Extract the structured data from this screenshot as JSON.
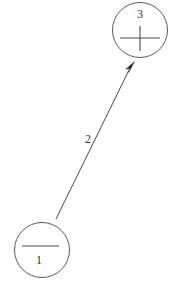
{
  "diagram": {
    "background_color": "#ffffff",
    "stroke_color": "#595959",
    "text_color": "#333333",
    "arrow_color": "#1a1a1a",
    "nodes": [
      {
        "id": "node-1",
        "label": "1",
        "symbol": "minus-sign",
        "symbol_glyph": "−",
        "cx": 42,
        "cy": 250,
        "r": 28
      },
      {
        "id": "node-3",
        "label": "3",
        "symbol": "plus-sign",
        "symbol_glyph": "+",
        "cx": 140,
        "cy": 30,
        "r": 28
      }
    ],
    "edges": [
      {
        "id": "edge-2",
        "label": "2",
        "from": "node-1",
        "to": "node-3",
        "direction": "node-1-to-node-3",
        "label_x": 88,
        "label_y": 140
      }
    ]
  }
}
